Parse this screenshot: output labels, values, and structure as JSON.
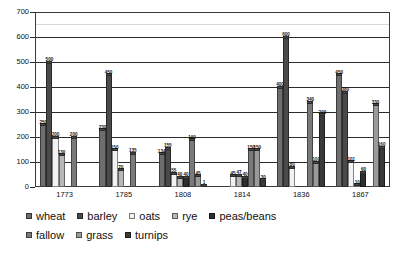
{
  "chart_data": {
    "type": "bar",
    "title": "",
    "subtitle": "",
    "xlabel": "",
    "ylabel": "",
    "ylim": [
      0,
      700
    ],
    "ytick_step": 100,
    "yticks": [
      "0",
      "100",
      "200",
      "300",
      "400",
      "500",
      "600",
      "700"
    ],
    "grid": true,
    "grid_axis": "y",
    "legend_position": "bottom",
    "categories": [
      "1773",
      "1785",
      "1808",
      "1814",
      "1836",
      "1867"
    ],
    "series": [
      {
        "name": "wheat",
        "color": "#6e6e6e",
        "values": [
          250,
          230,
          134,
          null,
          400,
          450
        ]
      },
      {
        "name": "barley",
        "color": "#4a4a4a",
        "values": [
          500,
          450,
          155,
          null,
          600,
          380
        ]
      },
      {
        "name": "oats",
        "color": "#f2f2f2",
        "values": [
          200,
          150,
          55,
          45,
          80,
          101
        ]
      },
      {
        "name": "rye",
        "color": "#b8b8b8",
        "values": [
          130,
          70,
          40,
          47,
          null,
          10
        ]
      },
      {
        "name": "peas/beans",
        "color": "#2e2e2e",
        "values": [
          null,
          null,
          40,
          40,
          null,
          60
        ]
      },
      {
        "name": "fallow",
        "color": "#7a7a7a",
        "values": [
          200,
          135,
          190,
          150,
          340,
          null
        ]
      },
      {
        "name": "grass",
        "color": "#9a9a9a",
        "values": [
          null,
          null,
          45,
          150,
          100,
          330
        ]
      },
      {
        "name": "turnips",
        "color": "#3a3a3a",
        "values": [
          null,
          null,
          1,
          30,
          290,
          160
        ]
      }
    ],
    "bar_labels": {
      "1773": [
        "250",
        "500",
        "200",
        "130",
        "",
        "200",
        "",
        ""
      ],
      "1785": [
        "230",
        "450",
        "150",
        "70",
        "",
        "135",
        "",
        ""
      ],
      "1808": [
        "134",
        "155",
        "55",
        "40",
        "40",
        "190",
        "45",
        "1"
      ],
      "1814": [
        "",
        "",
        "45",
        "47",
        "40",
        "150",
        "150",
        "30"
      ],
      "1836": [
        "400",
        "600",
        "80",
        "",
        "",
        "340",
        "100",
        "290"
      ],
      "1867": [
        "450",
        "380",
        "101",
        "10",
        "60",
        "",
        "330",
        "160"
      ]
    }
  },
  "legend": {
    "row1": [
      {
        "label": "wheat"
      },
      {
        "label": "barley"
      },
      {
        "label": "oats"
      },
      {
        "label": "rye"
      },
      {
        "label": "peas/beans"
      }
    ],
    "row2": [
      {
        "label": "fallow"
      },
      {
        "label": "grass"
      },
      {
        "label": "turnips"
      }
    ]
  }
}
